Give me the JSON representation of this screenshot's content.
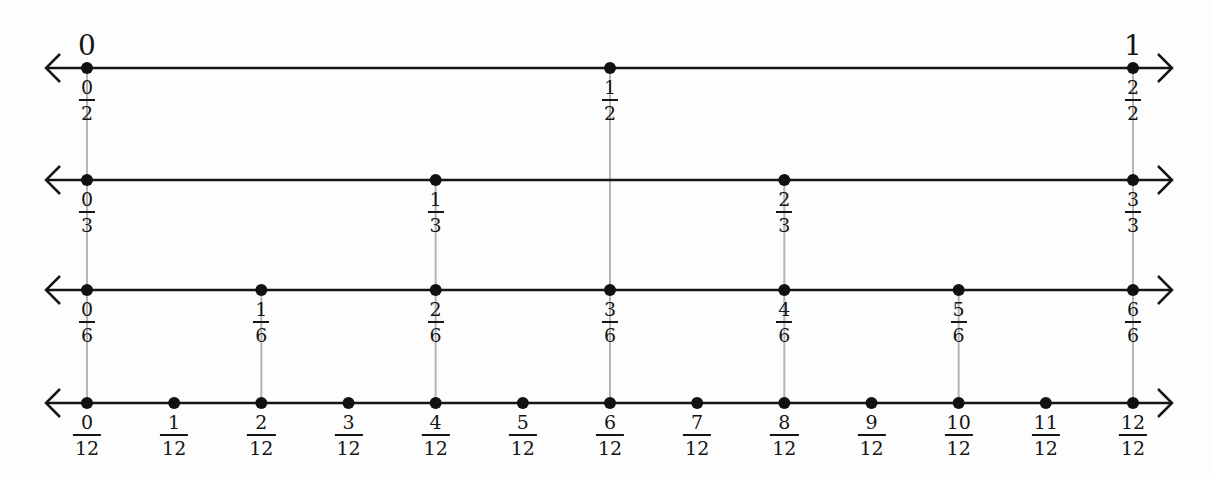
{
  "diagram": {
    "end_labels": {
      "left": "0",
      "right": "1"
    },
    "colors": {
      "line": "#151515",
      "point": "#111111",
      "connector": "#b5b5b5",
      "background": "#fdfdfd"
    },
    "layout": {
      "x0": 87,
      "x1": 1133,
      "arrow_left": 46,
      "arrow_right": 1172
    },
    "lines": [
      {
        "denominator": 2,
        "y": 68,
        "points": [
          {
            "num": "0",
            "den": "2"
          },
          {
            "num": "1",
            "den": "2"
          },
          {
            "num": "2",
            "den": "2"
          }
        ]
      },
      {
        "denominator": 3,
        "y": 180,
        "points": [
          {
            "num": "0",
            "den": "3"
          },
          {
            "num": "1",
            "den": "3"
          },
          {
            "num": "2",
            "den": "3"
          },
          {
            "num": "3",
            "den": "3"
          }
        ]
      },
      {
        "denominator": 6,
        "y": 290,
        "points": [
          {
            "num": "0",
            "den": "6"
          },
          {
            "num": "1",
            "den": "6"
          },
          {
            "num": "2",
            "den": "6"
          },
          {
            "num": "3",
            "den": "6"
          },
          {
            "num": "4",
            "den": "6"
          },
          {
            "num": "5",
            "den": "6"
          },
          {
            "num": "6",
            "den": "6"
          }
        ]
      },
      {
        "denominator": 12,
        "y": 403,
        "points": [
          {
            "num": "0",
            "den": "12"
          },
          {
            "num": "1",
            "den": "12"
          },
          {
            "num": "2",
            "den": "12"
          },
          {
            "num": "3",
            "den": "12"
          },
          {
            "num": "4",
            "den": "12"
          },
          {
            "num": "5",
            "den": "12"
          },
          {
            "num": "6",
            "den": "12"
          },
          {
            "num": "7",
            "den": "12"
          },
          {
            "num": "8",
            "den": "12"
          },
          {
            "num": "9",
            "den": "12"
          },
          {
            "num": "10",
            "den": "12"
          },
          {
            "num": "11",
            "den": "12"
          },
          {
            "num": "12",
            "den": "12"
          }
        ]
      }
    ],
    "connectors": [
      {
        "value": "0",
        "from_line": 0,
        "to_line": 3
      },
      {
        "value": "1/6",
        "from_line": 2,
        "to_line": 3
      },
      {
        "value": "1/3",
        "from_line": 1,
        "to_line": 3
      },
      {
        "value": "1/2",
        "from_line": 0,
        "to_line": 3
      },
      {
        "value": "2/3",
        "from_line": 1,
        "to_line": 3
      },
      {
        "value": "5/6",
        "from_line": 2,
        "to_line": 3
      },
      {
        "value": "1",
        "from_line": 0,
        "to_line": 3
      }
    ]
  }
}
